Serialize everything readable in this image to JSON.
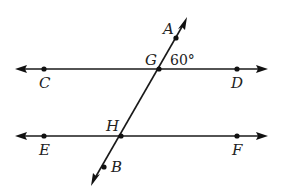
{
  "diagram": {
    "type": "parallel-lines-transversal",
    "lines": [
      {
        "name": "line-CD",
        "points": [
          "C",
          "G",
          "D"
        ]
      },
      {
        "name": "line-EF",
        "points": [
          "E",
          "H",
          "F"
        ]
      },
      {
        "name": "transversal-AB",
        "points": [
          "A",
          "G",
          "H",
          "B"
        ]
      }
    ],
    "labels": {
      "A": "A",
      "B": "B",
      "C": "C",
      "D": "D",
      "E": "E",
      "F": "F",
      "G": "G",
      "H": "H"
    },
    "angle": {
      "vertex": "G",
      "between": [
        "A",
        "D"
      ],
      "text": "60°",
      "value_degrees": 60
    }
  }
}
